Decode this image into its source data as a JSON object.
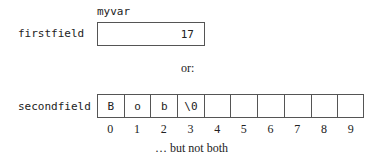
{
  "var_name": "myvar",
  "first": {
    "label": "firstfield",
    "value": "17"
  },
  "separator": "or:",
  "second": {
    "label": "secondfield",
    "cells": [
      "B",
      "o",
      "b",
      "\\0",
      "",
      "",
      "",
      "",
      "",
      ""
    ],
    "indices": [
      "0",
      "1",
      "2",
      "3",
      "4",
      "5",
      "6",
      "7",
      "8",
      "9"
    ]
  },
  "caption": "… but not both"
}
